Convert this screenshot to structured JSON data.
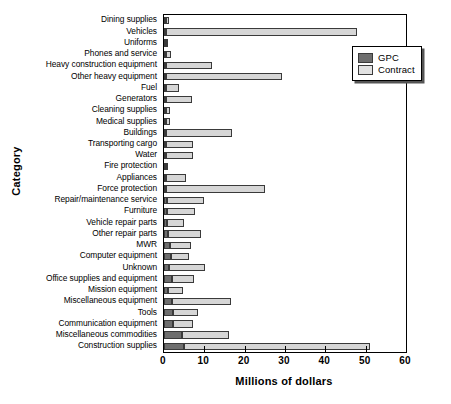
{
  "chart_data": {
    "type": "bar",
    "orientation": "horizontal",
    "stacked": true,
    "title": "",
    "xlabel": "Millions of dollars",
    "ylabel": "Category",
    "xlim": [
      0,
      60
    ],
    "xticks": [
      0,
      10,
      20,
      30,
      40,
      50,
      60
    ],
    "grid": false,
    "legend_position": "top-right",
    "legend": [
      "GPC",
      "Contract"
    ],
    "colors": {
      "GPC": "#6e6e6e",
      "Contract": "#d6d6d6"
    },
    "categories": [
      "Dining supplies",
      "Vehicles",
      "Uniforms",
      "Phones and service",
      "Heavy construction equipment",
      "Other heavy equipment",
      "Fuel",
      "Generators",
      "Cleaning supplies",
      "Medical supplies",
      "Buildings",
      "Transporting cargo",
      "Water",
      "Fire protection",
      "Appliances",
      "Force protection",
      "Repair/maintenance service",
      "Furniture",
      "Vehicle repair parts",
      "Other repair parts",
      "MWR",
      "Computer equipment",
      "Unknown",
      "Office supplies and equipment",
      "Mission equipment",
      "Miscellaneous equipment",
      "Tools",
      "Communication equipment",
      "Miscellaneous commodities",
      "Construction supplies"
    ],
    "series": [
      {
        "name": "GPC",
        "values": [
          0.1,
          0.2,
          0.2,
          0.2,
          0.2,
          0.2,
          0.2,
          0.2,
          0.2,
          0.2,
          0.2,
          0.3,
          0.3,
          0.3,
          0.3,
          0.4,
          0.7,
          0.7,
          0.8,
          1.1,
          1.6,
          1.8,
          1.2,
          2.1,
          1.0,
          1.9,
          2.3,
          2.2,
          4.4,
          5.0
        ]
      },
      {
        "name": "Contract",
        "values": [
          0.8,
          47.3,
          0.3,
          1.2,
          11.5,
          28.8,
          3.2,
          6.5,
          0.9,
          0.9,
          16.3,
          6.6,
          6.7,
          0.3,
          5.0,
          24.6,
          9.1,
          7.0,
          4.2,
          8.1,
          5.0,
          4.5,
          8.9,
          5.3,
          3.6,
          14.6,
          6.2,
          5.1,
          11.7,
          46.0
        ]
      }
    ],
    "totals": [
      0.9,
      47.5,
      0.5,
      1.4,
      11.7,
      29.0,
      3.4,
      6.7,
      1.1,
      1.1,
      16.5,
      6.9,
      7.0,
      0.6,
      5.3,
      25.0,
      9.8,
      7.7,
      5.0,
      9.2,
      6.6,
      6.3,
      10.1,
      7.4,
      4.6,
      16.5,
      8.5,
      7.3,
      16.1,
      51.0
    ]
  }
}
